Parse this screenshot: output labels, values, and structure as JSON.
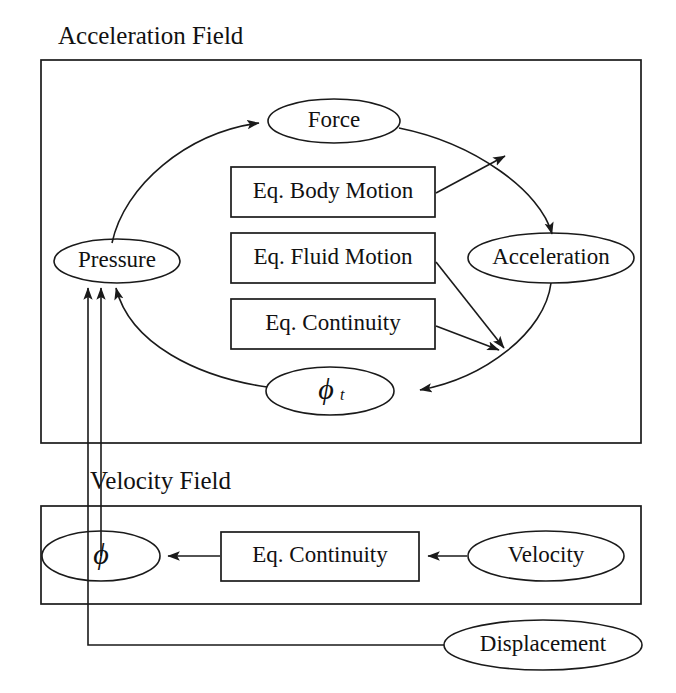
{
  "diagram": {
    "title_visible": false,
    "containers": [
      {
        "id": "acceleration-field",
        "label": "Acceleration Field"
      },
      {
        "id": "velocity-field",
        "label": "Velocity Field"
      }
    ],
    "nodes": [
      {
        "id": "force",
        "label": "Force",
        "shape": "ellipse"
      },
      {
        "id": "acceleration",
        "label": "Acceleration",
        "shape": "ellipse"
      },
      {
        "id": "pressure",
        "label": "Pressure",
        "shape": "ellipse"
      },
      {
        "id": "phi-t",
        "label": "ϕ",
        "subscript": "t",
        "shape": "ellipse"
      },
      {
        "id": "phi",
        "label": "ϕ",
        "subscript": "",
        "shape": "ellipse"
      },
      {
        "id": "velocity",
        "label": "Velocity",
        "shape": "ellipse"
      },
      {
        "id": "displacement",
        "label": "Displacement",
        "shape": "ellipse"
      }
    ],
    "process_boxes": [
      {
        "id": "eq-body-motion",
        "label": "Eq. Body Motion"
      },
      {
        "id": "eq-fluid-motion",
        "label": "Eq. Fluid Motion"
      },
      {
        "id": "eq-continuity-acc",
        "label": "Eq. Continuity"
      },
      {
        "id": "eq-continuity-vel",
        "label": "Eq. Continuity"
      }
    ],
    "edges": [
      {
        "from": "pressure",
        "to": "force",
        "style": "curved"
      },
      {
        "from": "force",
        "to": "acceleration",
        "style": "curved"
      },
      {
        "from": "eq-body-motion",
        "to": "acceleration",
        "style": "straight"
      },
      {
        "from": "acceleration",
        "to": "phi-t",
        "style": "curved"
      },
      {
        "from": "eq-fluid-motion",
        "to": "phi-t-join",
        "style": "straight"
      },
      {
        "from": "eq-continuity-acc",
        "to": "phi-t-join",
        "style": "straight"
      },
      {
        "from": "phi-t",
        "to": "pressure",
        "style": "curved"
      },
      {
        "from": "eq-continuity-vel",
        "to": "phi",
        "style": "straight"
      },
      {
        "from": "velocity",
        "to": "eq-continuity-vel",
        "style": "straight"
      },
      {
        "from": "phi",
        "to": "pressure",
        "style": "orthogonal"
      },
      {
        "from": "displacement",
        "to": "pressure",
        "style": "orthogonal"
      }
    ],
    "colors": {
      "stroke": "#1a1a1a",
      "background": "#ffffff",
      "text": "#111111"
    }
  }
}
